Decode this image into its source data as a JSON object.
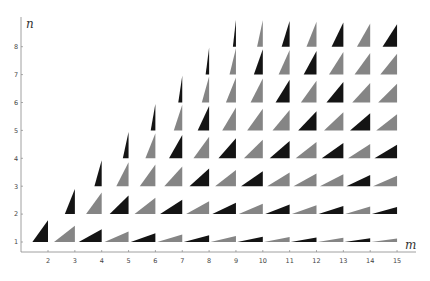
{
  "chart_data": {
    "type": "scatter",
    "title": "",
    "xlabel": "m",
    "ylabel": "n",
    "x_ticks": [
      2,
      3,
      4,
      5,
      6,
      7,
      8,
      9,
      10,
      11,
      12,
      13,
      14,
      15
    ],
    "y_ticks": [
      1,
      2,
      3,
      4,
      5,
      6,
      7,
      8
    ],
    "xlim": [
      1.0,
      15.7
    ],
    "ylim": [
      0.4,
      9.0
    ],
    "grid": false,
    "marker": "right triangle with legs proportional to (m^2-n^2, 2mn), unit hypotenuse, right angle at (m,n)",
    "colors": {
      "primitive": "#141414",
      "non_primitive": "#858585"
    },
    "legend": [],
    "series": [
      {
        "name": "primitive (m+n odd, gcd(m,n)=1)",
        "color": "#141414"
      },
      {
        "name": "non-primitive",
        "color": "#858585"
      }
    ],
    "points": [
      {
        "m": 2,
        "n": 1,
        "p": 1
      },
      {
        "m": 3,
        "n": 1,
        "p": 0
      },
      {
        "m": 4,
        "n": 1,
        "p": 1
      },
      {
        "m": 5,
        "n": 1,
        "p": 0
      },
      {
        "m": 6,
        "n": 1,
        "p": 1
      },
      {
        "m": 7,
        "n": 1,
        "p": 0
      },
      {
        "m": 8,
        "n": 1,
        "p": 1
      },
      {
        "m": 9,
        "n": 1,
        "p": 0
      },
      {
        "m": 10,
        "n": 1,
        "p": 1
      },
      {
        "m": 11,
        "n": 1,
        "p": 0
      },
      {
        "m": 12,
        "n": 1,
        "p": 1
      },
      {
        "m": 13,
        "n": 1,
        "p": 0
      },
      {
        "m": 14,
        "n": 1,
        "p": 1
      },
      {
        "m": 15,
        "n": 1,
        "p": 0
      },
      {
        "m": 3,
        "n": 2,
        "p": 1
      },
      {
        "m": 4,
        "n": 2,
        "p": 0
      },
      {
        "m": 5,
        "n": 2,
        "p": 1
      },
      {
        "m": 6,
        "n": 2,
        "p": 0
      },
      {
        "m": 7,
        "n": 2,
        "p": 1
      },
      {
        "m": 8,
        "n": 2,
        "p": 0
      },
      {
        "m": 9,
        "n": 2,
        "p": 1
      },
      {
        "m": 10,
        "n": 2,
        "p": 0
      },
      {
        "m": 11,
        "n": 2,
        "p": 1
      },
      {
        "m": 12,
        "n": 2,
        "p": 0
      },
      {
        "m": 13,
        "n": 2,
        "p": 1
      },
      {
        "m": 14,
        "n": 2,
        "p": 0
      },
      {
        "m": 15,
        "n": 2,
        "p": 1
      },
      {
        "m": 4,
        "n": 3,
        "p": 1
      },
      {
        "m": 5,
        "n": 3,
        "p": 0
      },
      {
        "m": 6,
        "n": 3,
        "p": 0
      },
      {
        "m": 7,
        "n": 3,
        "p": 0
      },
      {
        "m": 8,
        "n": 3,
        "p": 1
      },
      {
        "m": 9,
        "n": 3,
        "p": 0
      },
      {
        "m": 10,
        "n": 3,
        "p": 1
      },
      {
        "m": 11,
        "n": 3,
        "p": 0
      },
      {
        "m": 12,
        "n": 3,
        "p": 0
      },
      {
        "m": 13,
        "n": 3,
        "p": 0
      },
      {
        "m": 14,
        "n": 3,
        "p": 1
      },
      {
        "m": 15,
        "n": 3,
        "p": 0
      },
      {
        "m": 5,
        "n": 4,
        "p": 1
      },
      {
        "m": 6,
        "n": 4,
        "p": 0
      },
      {
        "m": 7,
        "n": 4,
        "p": 1
      },
      {
        "m": 8,
        "n": 4,
        "p": 0
      },
      {
        "m": 9,
        "n": 4,
        "p": 1
      },
      {
        "m": 10,
        "n": 4,
        "p": 0
      },
      {
        "m": 11,
        "n": 4,
        "p": 1
      },
      {
        "m": 12,
        "n": 4,
        "p": 0
      },
      {
        "m": 13,
        "n": 4,
        "p": 1
      },
      {
        "m": 14,
        "n": 4,
        "p": 0
      },
      {
        "m": 15,
        "n": 4,
        "p": 1
      },
      {
        "m": 6,
        "n": 5,
        "p": 1
      },
      {
        "m": 7,
        "n": 5,
        "p": 0
      },
      {
        "m": 8,
        "n": 5,
        "p": 1
      },
      {
        "m": 9,
        "n": 5,
        "p": 0
      },
      {
        "m": 10,
        "n": 5,
        "p": 0
      },
      {
        "m": 11,
        "n": 5,
        "p": 0
      },
      {
        "m": 12,
        "n": 5,
        "p": 1
      },
      {
        "m": 13,
        "n": 5,
        "p": 0
      },
      {
        "m": 14,
        "n": 5,
        "p": 1
      },
      {
        "m": 15,
        "n": 5,
        "p": 0
      },
      {
        "m": 7,
        "n": 6,
        "p": 1
      },
      {
        "m": 8,
        "n": 6,
        "p": 0
      },
      {
        "m": 9,
        "n": 6,
        "p": 0
      },
      {
        "m": 10,
        "n": 6,
        "p": 0
      },
      {
        "m": 11,
        "n": 6,
        "p": 1
      },
      {
        "m": 12,
        "n": 6,
        "p": 0
      },
      {
        "m": 13,
        "n": 6,
        "p": 1
      },
      {
        "m": 14,
        "n": 6,
        "p": 0
      },
      {
        "m": 15,
        "n": 6,
        "p": 0
      },
      {
        "m": 8,
        "n": 7,
        "p": 1
      },
      {
        "m": 9,
        "n": 7,
        "p": 0
      },
      {
        "m": 10,
        "n": 7,
        "p": 1
      },
      {
        "m": 11,
        "n": 7,
        "p": 0
      },
      {
        "m": 12,
        "n": 7,
        "p": 1
      },
      {
        "m": 13,
        "n": 7,
        "p": 0
      },
      {
        "m": 14,
        "n": 7,
        "p": 0
      },
      {
        "m": 15,
        "n": 7,
        "p": 0
      },
      {
        "m": 9,
        "n": 8,
        "p": 1
      },
      {
        "m": 10,
        "n": 8,
        "p": 0
      },
      {
        "m": 11,
        "n": 8,
        "p": 1
      },
      {
        "m": 12,
        "n": 8,
        "p": 0
      },
      {
        "m": 13,
        "n": 8,
        "p": 1
      },
      {
        "m": 14,
        "n": 8,
        "p": 0
      },
      {
        "m": 15,
        "n": 8,
        "p": 1
      }
    ]
  },
  "axes": {
    "x_label": "m",
    "y_label": "n"
  }
}
